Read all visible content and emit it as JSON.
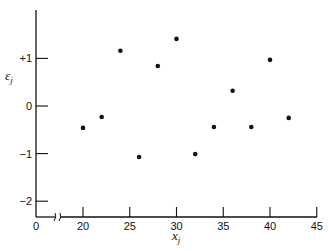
{
  "chart_data": {
    "type": "scatter",
    "title": "",
    "xlabel": "x",
    "xlabel_subscript": "j",
    "ylabel": "ε",
    "ylabel_subscript": "j",
    "xlim": [
      0,
      45
    ],
    "ylim": [
      -2.3,
      1.9
    ],
    "x_axis_break": true,
    "x_ticks": [
      0,
      20,
      25,
      30,
      35,
      40,
      45
    ],
    "x_tick_labels": [
      "0",
      "20",
      "25",
      "30",
      "35",
      "40",
      "45"
    ],
    "y_ticks": [
      1,
      0,
      -1,
      -2
    ],
    "y_tick_labels": [
      "+1",
      "0",
      "−1",
      "−2"
    ],
    "grid": false,
    "legend": null,
    "points": [
      {
        "x": 20,
        "y": -0.46
      },
      {
        "x": 22,
        "y": -0.23
      },
      {
        "x": 24,
        "y": 1.16
      },
      {
        "x": 26,
        "y": -1.07
      },
      {
        "x": 28,
        "y": 0.84
      },
      {
        "x": 30,
        "y": 1.41
      },
      {
        "x": 32,
        "y": -1.01
      },
      {
        "x": 34,
        "y": -0.44
      },
      {
        "x": 36,
        "y": 0.32
      },
      {
        "x": 38,
        "y": -0.44
      },
      {
        "x": 40,
        "y": 0.97
      },
      {
        "x": 42,
        "y": -0.25
      }
    ]
  },
  "colors": {
    "ink": "#111111",
    "background": "#ffffff"
  }
}
